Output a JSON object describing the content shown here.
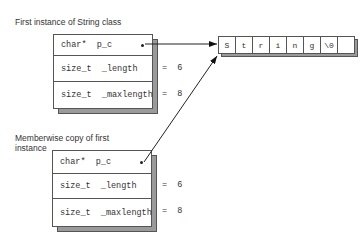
{
  "first_instance": {
    "label": "First instance of String class",
    "fields": [
      {
        "name": "char*  p_c",
        "value": ""
      },
      {
        "name": "size_t  _length",
        "value": "=  6"
      },
      {
        "name": "size_t  _maxlength",
        "value": "=  8"
      }
    ]
  },
  "copy_instance": {
    "label": "Memberwise copy of first instance",
    "fields": [
      {
        "name": "char*  p_c",
        "value": ""
      },
      {
        "name": "size_t  _length",
        "value": "=  6"
      },
      {
        "name": "size_t  _maxlength",
        "value": "=  8"
      }
    ]
  },
  "string_buffer": {
    "cells": [
      "S",
      "t",
      "r",
      "i",
      "n",
      "g",
      "\\0",
      ""
    ]
  },
  "colors": {
    "line": "#222222",
    "shadow": "#9a9a9a",
    "text": "#333333"
  }
}
